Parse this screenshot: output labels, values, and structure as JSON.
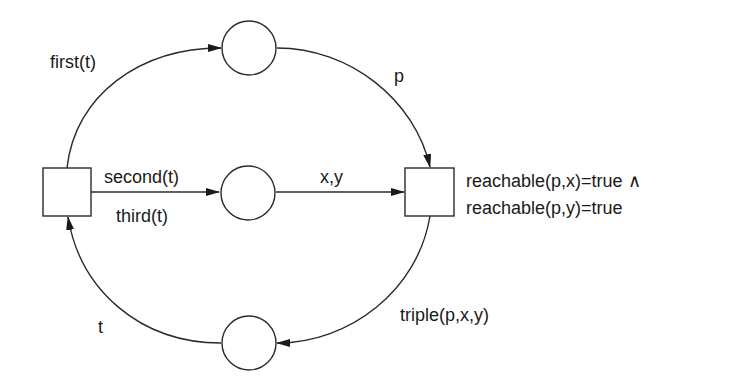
{
  "diagram": {
    "type": "petri-net",
    "transitions": [
      {
        "id": "t-left",
        "label": ""
      },
      {
        "id": "t-right",
        "label": "",
        "guard_lines": [
          "reachable(p,x)=true ∧",
          "reachable(p,y)=true"
        ]
      }
    ],
    "places": [
      {
        "id": "p-top"
      },
      {
        "id": "p-middle"
      },
      {
        "id": "p-bottom"
      }
    ],
    "arcs": [
      {
        "from": "t-left",
        "to": "p-top",
        "label": "first(t)"
      },
      {
        "from": "p-top",
        "to": "t-right",
        "label": "p"
      },
      {
        "from": "t-left",
        "to": "p-middle",
        "label_above": "second(t)",
        "label_below": "third(t)"
      },
      {
        "from": "p-middle",
        "to": "t-right",
        "label": "x,y"
      },
      {
        "from": "t-right",
        "to": "p-bottom",
        "label": "triple(p,x,y)"
      },
      {
        "from": "p-bottom",
        "to": "t-left",
        "label": "t"
      }
    ],
    "colors": {
      "stroke": "#2a2a2a",
      "text": "#1a1a1a",
      "background": "#ffffff"
    }
  }
}
